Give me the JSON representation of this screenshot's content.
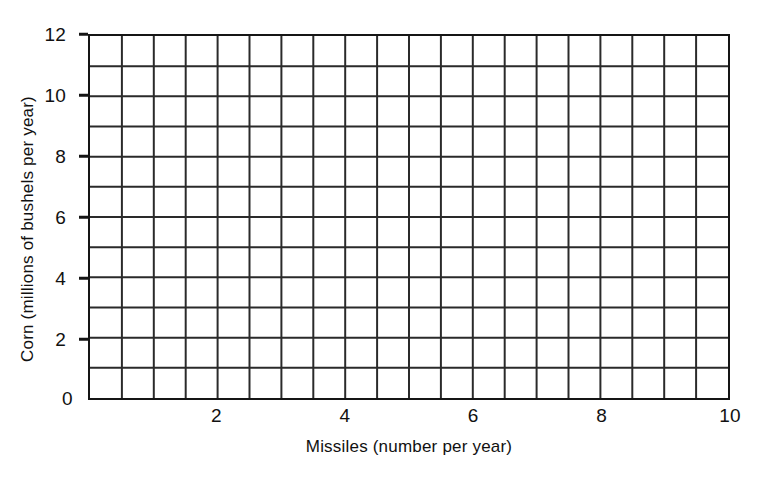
{
  "chart_data": {
    "type": "line",
    "title": "",
    "subtitle": "",
    "xlabel": "Missiles (number per year)",
    "ylabel": "Corn (millions of bushels per year)",
    "xlim": [
      0,
      10
    ],
    "ylim": [
      0,
      12
    ],
    "x_ticks": [
      0,
      2,
      4,
      6,
      8,
      10
    ],
    "x_tick_labels": [
      "0",
      "2",
      "4",
      "6",
      "8",
      "10"
    ],
    "y_ticks": [
      0,
      2,
      4,
      6,
      8,
      10,
      12
    ],
    "y_tick_labels": [
      "0",
      "2",
      "4",
      "6",
      "8",
      "10",
      "12"
    ],
    "x_minor_step": 0.5,
    "y_minor_step": 1,
    "grid": true,
    "grid_columns": 20,
    "grid_rows": 12,
    "legend": null,
    "legend_position": "none",
    "series": [],
    "annotations": [],
    "colors": {
      "background": "#ffffff",
      "grid_line": "#2a2a2a",
      "axis_line": "#151515",
      "text": "#111111"
    }
  },
  "axes": {
    "origin_label": "0",
    "x_labels": [
      {
        "value": 2,
        "text": "2"
      },
      {
        "value": 4,
        "text": "4"
      },
      {
        "value": 6,
        "text": "6"
      },
      {
        "value": 8,
        "text": "8"
      },
      {
        "value": 10,
        "text": "10"
      }
    ],
    "y_labels": [
      {
        "value": 2,
        "text": "2"
      },
      {
        "value": 4,
        "text": "4"
      },
      {
        "value": 6,
        "text": "6"
      },
      {
        "value": 8,
        "text": "8"
      },
      {
        "value": 10,
        "text": "10"
      },
      {
        "value": 12,
        "text": "12"
      }
    ]
  }
}
